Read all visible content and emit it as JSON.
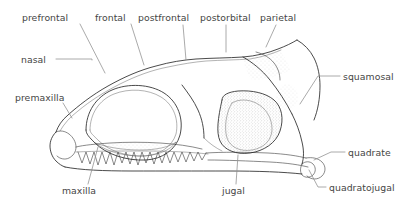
{
  "figure": {
    "kind": "anatomical-line-drawing",
    "background_color": "#ffffff",
    "outline_color": "#2b2b2b",
    "leader_color": "#8d8d8d",
    "label_color": "#454545",
    "stipple_color": "#9a9a9a"
  },
  "labels": [
    {
      "id": "prefrontal",
      "text": "prefrontal",
      "x": 22,
      "y": 12
    },
    {
      "id": "frontal",
      "text": "frontal",
      "x": 95,
      "y": 12
    },
    {
      "id": "postfrontal",
      "text": "postfrontal",
      "x": 138,
      "y": 12
    },
    {
      "id": "postorbital",
      "text": "postorbital",
      "x": 200,
      "y": 12
    },
    {
      "id": "parietal",
      "text": "parietal",
      "x": 260,
      "y": 12
    },
    {
      "id": "nasal",
      "text": "nasal",
      "x": 21,
      "y": 54
    },
    {
      "id": "premaxilla",
      "text": "premaxilla",
      "x": 15,
      "y": 92
    },
    {
      "id": "squamosal",
      "text": "squamosal",
      "x": 343,
      "y": 71
    },
    {
      "id": "quadrate",
      "text": "quadrate",
      "x": 348,
      "y": 147
    },
    {
      "id": "maxilla",
      "text": "maxilla",
      "x": 62,
      "y": 185
    },
    {
      "id": "jugal",
      "text": "jugal",
      "x": 222,
      "y": 185
    },
    {
      "id": "quadratojugal",
      "text": "quadratojugal",
      "x": 329,
      "y": 182
    }
  ],
  "leader_lines": [
    {
      "id": "leader-prefrontal",
      "d": "M 80 24 L 105 73"
    },
    {
      "id": "leader-frontal",
      "d": "M 131 24 L 144 65"
    },
    {
      "id": "leader-postfrontal",
      "d": "M 183 25 L 186 60"
    },
    {
      "id": "leader-postorbital",
      "d": "M 226 25 L 226 52"
    },
    {
      "id": "leader-parietal",
      "d": "M 276 25 L 266 47"
    },
    {
      "id": "leader-nasal",
      "d": "M 56 59 L 92 59 L 92 60"
    },
    {
      "id": "leader-premaxilla",
      "d": "M 63 103 L 72 118"
    },
    {
      "id": "leader-squamosal",
      "d": "M 340 76 L 318 76 L 300 104"
    },
    {
      "id": "leader-quadrate",
      "d": "M 345 152 L 331 152 L 314 160"
    },
    {
      "id": "leader-maxilla",
      "d": "M 88 184 L 98 147"
    },
    {
      "id": "leader-jugal",
      "d": "M 236 184 L 238 155"
    },
    {
      "id": "leader-quadratojugal",
      "d": "M 326 187 L 318 187 L 309 170"
    }
  ],
  "skull_paths": {
    "dorsal_margin": "M 56 132 C 58 126 62 120 68 115 C 78 106 92 95 108 86 C 124 77 140 70 156 66 C 170 62 183 60 196 59 C 212 58 228 58 243 57 C 256 56 268 53 278 49 C 286 46 292 43 297 40",
    "dorsal_inner": "M 60 131 C 64 124 70 117 78 111 C 90 101 104 92 120 84 C 136 76 152 70 168 67 C 182 64 194 62 206 61 C 222 60 236 60 250 59 C 262 57 272 54 281 50",
    "snout_tip": "M 56 132 C 52 136 50 141 50 146 C 50 151 52 157 56 161 C 59 164 62 166 65 167",
    "premaxilla_body": "M 56 132 C 60 130 65 131 69 134 C 73 137 76 142 76 147 C 76 152 73 156 69 158 C 65 160 60 159 57 156",
    "premaxilla_tooth1": "M 57 157 L 56 168 L 59 170 L 61 167 L 62 157",
    "premaxilla_tooth2": "M 63 158 L 63 169 L 66 171 L 68 168 L 68 158",
    "premaxilla_tooth3": "M 69 158 L 70 168 L 72 170 L 74 167 L 74 157",
    "naris": "M 64 146 C 62 146 61 148 62 150 C 63 152 66 152 67 150 C 68 148 66 146 64 146",
    "maxilla_upper": "M 76 147 C 84 145 96 144 110 143 C 126 142 144 142 160 143 C 176 144 190 146 202 149",
    "tooth_row": "M 78 152 L 82 163 L 86 152 L 90 164 L 94 152 L 98 165 L 102 152 L 106 164 L 110 152 L 114 165 L 118 152 L 122 163 L 126 152 L 130 164 L 134 152 L 138 165 L 142 152 L 146 163 L 150 152 L 154 164 L 158 152 L 162 163 L 166 152 L 170 163 L 174 152 L 178 162 L 182 152 L 186 162 L 190 152 L 194 161 L 198 152 L 202 160 L 206 153",
    "tooth_base_line": "M 76 152 C 96 151 120 151 144 151 C 168 151 190 152 208 154",
    "ventral_margin": "M 65 167 C 80 170 104 171 132 171 C 162 171 196 171 228 171 C 258 171 284 172 302 174",
    "jugal_bar_upper": "M 206 153 C 222 152 244 152 268 153 C 286 154 298 156 306 158",
    "jugal_bar_lower": "M 208 160 C 226 160 248 161 270 162 C 288 163 300 165 308 167",
    "orbit": "M 86 130 C 86 112 96 97 112 90 C 128 83 150 84 164 93 C 178 102 184 119 180 135 C 176 150 162 159 146 160 C 126 161 106 154 95 143 C 89 137 86 134 86 130",
    "orbit_inner": "M 90 130 C 90 114 99 100 114 94 C 129 88 148 89 161 97 C 174 105 179 120 176 134 C 172 147 159 155 145 156 C 127 157 109 151 99 141 C 93 135 90 133 90 130",
    "orbit_floor_shade": "M 95 143 C 106 151 122 156 140 156 C 156 156 170 151 176 142 C 170 147 156 150 140 150 C 122 150 106 147 95 143",
    "prefrontal_seam": "M 96 105 C 100 101 106 98 112 96",
    "frontal_seam1": "M 122 83 C 128 91 134 96 140 99",
    "frontal_seam2": "M 140 72 C 146 79 150 85 154 90",
    "postfrontal_seam": "M 172 64 C 176 71 180 78 182 85",
    "postorbital_bar": "M 182 85 C 188 93 194 101 198 110 C 202 119 204 128 204 138",
    "postorbital_bar2": "M 188 84 C 194 92 200 101 204 110 C 208 120 210 129 210 140",
    "squamosal_edge": "M 243 57 C 252 62 262 70 270 80 C 278 90 286 102 292 114",
    "squamosal_edge2": "M 250 59 C 259 65 268 74 276 84 C 284 95 291 107 296 118",
    "parietal_crest": "M 256 52 C 264 54 270 58 274 63 C 278 68 280 74 280 80",
    "temporal_fenestra": "M 222 100 C 222 95 228 92 238 91 C 252 90 266 93 274 100 C 282 107 284 119 280 131 C 276 143 264 151 250 153 C 236 155 224 150 220 141 C 216 132 218 118 222 100",
    "temporal_fenestra_inner": "M 232 103 C 238 99 248 99 256 103 C 266 108 272 118 272 129 C 272 140 264 148 252 150 C 240 152 230 147 227 138 C 224 128 226 112 232 103",
    "quadrate_shaft": "M 292 114 C 296 122 300 132 302 142 C 304 150 304 158 302 164",
    "quadrate_shaft2": "M 298 118 C 302 126 306 136 308 146 C 310 154 310 162 308 168",
    "quadrate_condyle": "M 302 164 C 300 168 300 172 302 175 C 305 178 310 178 313 175 C 316 172 316 167 313 164 C 310 161 305 161 302 164",
    "quadratojugal_flange": "M 306 158 C 312 157 318 158 322 162 C 326 166 326 172 322 176 C 318 180 311 180 307 176",
    "occipital_edge": "M 297 40 C 304 44 310 50 314 58 C 318 66 320 76 320 86 C 320 98 318 110 314 120",
    "occipital_edge2": "M 303 44 C 309 48 314 55 318 63 C 322 72 324 82 324 92 C 324 104 322 114 318 124",
    "notch1": "M 196 59 L 200 54 L 206 56 L 210 52 L 216 54",
    "notch2": "M 234 58 L 238 52 L 243 55 L 247 50",
    "suture_zigzag1": "M 186 108 L 194 104 L 196 110 L 204 106 L 208 112 L 216 108",
    "suture_zigzag2": "M 204 122 L 212 119 L 214 124 L 220 121",
    "cheek_seam": "M 204 138 C 210 144 216 148 222 151",
    "small_foramen1": "M 90 138 C 89 138 88 139 89 140 C 90 141 91 140 91 139",
    "small_foramen2": "M 98 137 C 97 137 96 138 97 139 C 98 140 99 139 99 138"
  },
  "stipple_regions": [
    {
      "id": "orbit-floor-stipple",
      "cx": 135,
      "cy": 150,
      "rx": 42,
      "ry": 7
    },
    {
      "id": "temporal-fenestra-stipple",
      "cx": 250,
      "cy": 122,
      "rx": 30,
      "ry": 30
    },
    {
      "id": "parietal-stipple",
      "cx": 262,
      "cy": 66,
      "rx": 22,
      "ry": 9
    },
    {
      "id": "squamosal-stipple",
      "cx": 286,
      "cy": 96,
      "rx": 12,
      "ry": 12
    }
  ]
}
